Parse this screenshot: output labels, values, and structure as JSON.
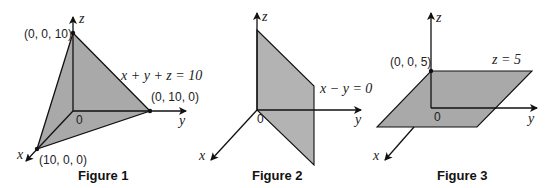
{
  "colors": {
    "plane_fill": "#a9a9a9",
    "axis": "#111111",
    "background": "#ffffff"
  },
  "figures": [
    {
      "caption": "Figure 1",
      "equation": "x + y + z = 10",
      "axis_labels": {
        "x": "x",
        "y": "y",
        "z": "z"
      },
      "origin_label": "0",
      "points": [
        {
          "label": "(0, 0, 10)"
        },
        {
          "label": "(0, 10, 0)"
        },
        {
          "label": "(10, 0, 0)"
        }
      ]
    },
    {
      "caption": "Figure 2",
      "equation": "x − y = 0",
      "axis_labels": {
        "x": "x",
        "y": "y",
        "z": "z"
      },
      "origin_label": "0"
    },
    {
      "caption": "Figure 3",
      "equation": "z = 5",
      "axis_labels": {
        "x": "x",
        "y": "y",
        "z": "z"
      },
      "origin_label": "0",
      "points": [
        {
          "label": "(0, 0, 5)"
        }
      ]
    }
  ]
}
